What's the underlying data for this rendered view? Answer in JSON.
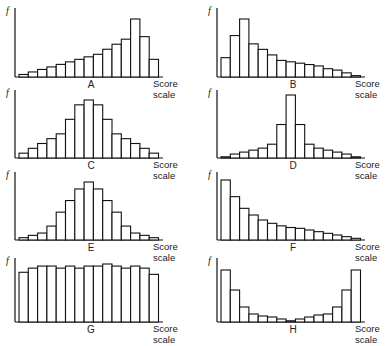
{
  "chart_data": [
    {
      "type": "bar",
      "panel": "A",
      "title": "A",
      "xlabel": "Score scale",
      "ylabel": "f",
      "values": [
        1,
        2,
        3,
        4,
        5,
        6,
        7,
        8,
        9,
        11,
        13,
        15,
        23,
        16,
        7
      ],
      "description": "Negatively skewed distribution"
    },
    {
      "type": "bar",
      "panel": "B",
      "title": "B",
      "xlabel": "Score scale",
      "ylabel": "f",
      "values": [
        7,
        15,
        21,
        12,
        10,
        8,
        6,
        5.5,
        5,
        4.5,
        4,
        3,
        2.5,
        1.5,
        0.5
      ],
      "description": "Positively skewed distribution"
    },
    {
      "type": "bar",
      "panel": "C",
      "title": "C",
      "xlabel": "Score scale",
      "ylabel": "f",
      "values": [
        1,
        2,
        3,
        4,
        5,
        8,
        11,
        12,
        11,
        8,
        5,
        4,
        3,
        2,
        1
      ],
      "description": "Flat (platykurtic) symmetrical distribution"
    },
    {
      "type": "bar",
      "panel": "D",
      "title": "D",
      "xlabel": "Score scale",
      "ylabel": "f",
      "values": [
        0.5,
        2,
        3,
        4,
        5,
        7,
        17,
        32,
        17,
        7,
        5,
        4,
        3,
        2,
        0.5
      ],
      "description": "Peaked (leptokurtic) symmetrical distribution"
    },
    {
      "type": "bar",
      "panel": "E",
      "title": "E",
      "xlabel": "Score scale",
      "ylabel": "f",
      "values": [
        1,
        2,
        3,
        6,
        12,
        17,
        22,
        25,
        22,
        17,
        12,
        6,
        3,
        2,
        1
      ],
      "description": "Normal (bell-shaped) distribution"
    },
    {
      "type": "bar",
      "panel": "F",
      "title": "F",
      "xlabel": "Score scale",
      "ylabel": "f",
      "values": [
        36,
        26,
        19,
        15,
        12,
        10,
        8.5,
        7.5,
        7,
        6,
        5,
        4,
        3,
        2,
        1
      ],
      "description": "J-shaped (reverse) distribution"
    },
    {
      "type": "bar",
      "panel": "G",
      "title": "G",
      "xlabel": "Score scale",
      "ylabel": "f",
      "values": [
        24,
        26,
        27,
        27,
        26,
        27,
        26,
        27,
        27,
        28,
        27,
        26,
        27,
        26,
        23
      ],
      "description": "Rectangular (uniform) distribution"
    },
    {
      "type": "bar",
      "panel": "H",
      "title": "H",
      "xlabel": "Score scale",
      "ylabel": "f",
      "values": [
        52,
        32,
        15,
        8,
        6,
        5,
        3,
        1,
        3,
        5,
        7,
        8,
        15,
        32,
        52
      ],
      "description": "U-shaped distribution"
    }
  ],
  "labels": {
    "f": "f",
    "score": "Score",
    "scale": "scale",
    "panels": [
      "A",
      "B",
      "C",
      "D",
      "E",
      "F",
      "G",
      "H"
    ]
  },
  "layout": {
    "panels": [
      {
        "ax": 15,
        "base": 77,
        "top": 8,
        "maxh": 58
      },
      {
        "ax": 217,
        "base": 77,
        "top": 8,
        "maxh": 58
      },
      {
        "ax": 15,
        "base": 158,
        "top": 90,
        "maxh": 58
      },
      {
        "ax": 217,
        "base": 158,
        "top": 90,
        "maxh": 63
      },
      {
        "ax": 15,
        "base": 240,
        "top": 172,
        "maxh": 58
      },
      {
        "ax": 217,
        "base": 240,
        "top": 172,
        "maxh": 60
      },
      {
        "ax": 15,
        "base": 322,
        "top": 258,
        "maxh": 58
      },
      {
        "ax": 217,
        "base": 322,
        "top": 258,
        "maxh": 52
      }
    ]
  }
}
